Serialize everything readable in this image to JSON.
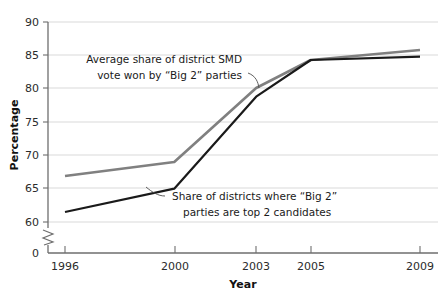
{
  "chart_data": {
    "type": "line",
    "title": "",
    "xlabel": "Year",
    "ylabel": "Percentage",
    "x": [
      1996,
      2000,
      2003,
      2005,
      2009
    ],
    "xtick_labels": [
      "1996",
      "2000",
      "2003",
      "2005",
      "2009"
    ],
    "ytick_labels": [
      "0",
      "60",
      "65",
      "70",
      "75",
      "80",
      "85",
      "90"
    ],
    "ylim": [
      60,
      90
    ],
    "y_axis_break": true,
    "y_break_label": "0",
    "grid": "horizontal",
    "legend_position": "inline-annotations",
    "series": [
      {
        "name": "Average share of district SMD vote won by “Big 2” parties",
        "color": "#808080",
        "values": [
          66.9,
          69.0,
          80.1,
          84.3,
          85.8
        ]
      },
      {
        "name": "Share of districts where “Big 2” parties are top 2 candidates",
        "color": "#1a1a1a",
        "values": [
          61.5,
          65.0,
          78.8,
          84.3,
          84.8
        ]
      }
    ],
    "annotations": [
      {
        "id": "annotation-gray",
        "lines": [
          "Average share of district SMD",
          "vote won by “Big 2” parties"
        ]
      },
      {
        "id": "annotation-black",
        "lines": [
          "Share of districts where “Big 2”",
          "parties are top 2 candidates"
        ]
      }
    ]
  },
  "axes": {
    "y_title": "Percentage",
    "x_title": "Year"
  },
  "ylabels": {
    "t90": "90",
    "t85": "85",
    "t80": "80",
    "t75": "75",
    "t70": "70",
    "t65": "65",
    "t60": "60",
    "t0": "0"
  },
  "xlabels": {
    "t1996": "1996",
    "t2000": "2000",
    "t2003": "2003",
    "t2005": "2005",
    "t2009": "2009"
  },
  "annotation_gray": {
    "line1": "Average share of district SMD",
    "line2": "vote won by “Big 2” parties"
  },
  "annotation_black": {
    "line1": "Share of districts where “Big 2”",
    "line2": "parties are top 2 candidates"
  }
}
